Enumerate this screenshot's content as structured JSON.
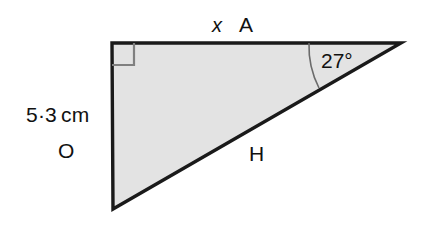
{
  "figure": {
    "type": "right-triangle-trigonometry-diagram",
    "background_color": "#ffffff",
    "fill_color": "#e3e3e3",
    "stroke_color": "#1a1a1a",
    "marker_color": "#808080",
    "labels": {
      "side_length_value": "5·3",
      "side_length_unit": "cm",
      "opposite": "O",
      "unknown": "x",
      "adjacent": "A",
      "angle": "27°",
      "hypotenuse": "H"
    },
    "geometry": {
      "top_left_vertex": [
        112,
        43
      ],
      "bottom_left_vertex": [
        113,
        209
      ],
      "right_vertex": [
        401,
        43
      ],
      "right_angle_marker_size": 22,
      "angle_arc_radius": 92
    }
  }
}
